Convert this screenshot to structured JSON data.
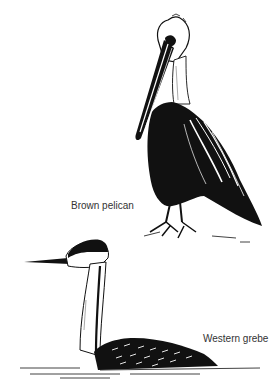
{
  "figure": {
    "birds": [
      {
        "id": "pelican",
        "label": "Brown pelican"
      },
      {
        "id": "grebe",
        "label": "Western grebe"
      }
    ],
    "colors": {
      "ink": "#111111",
      "background": "#ffffff",
      "label_text": "#333333"
    }
  }
}
